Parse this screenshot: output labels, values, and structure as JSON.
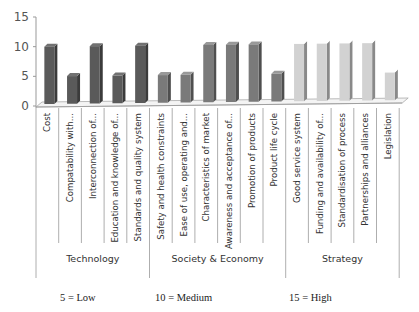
{
  "chart_data": {
    "type": "bar",
    "title": "",
    "xlabel": "",
    "ylabel": "",
    "ylim": [
      0,
      15
    ],
    "yticks": [
      0,
      5,
      10,
      15
    ],
    "grid": false,
    "style": "3d-column",
    "categories": [
      "Cost",
      "Compatability with...",
      "Interconnection of...",
      "Education and knowledge of...",
      "Standards and quality system",
      "Safety and health constraints",
      "Ease of use, operating and...",
      "Characteristics of market",
      "Awareness and acceptance of...",
      "Promotion of products",
      "Product life cycle",
      "Good service system",
      "Funding and availability of...",
      "Standardisation of process",
      "Partnerships and alliances",
      "Legislation"
    ],
    "values": [
      10,
      5,
      10,
      5,
      10,
      5,
      5,
      10,
      10,
      10,
      5,
      10,
      10,
      10,
      10,
      5
    ],
    "groups": [
      {
        "name": "Technology",
        "start": 0,
        "end": 4,
        "color": "#5a5a5a"
      },
      {
        "name": "Society & Economy",
        "start": 5,
        "end": 10,
        "color": "#7a7a7a"
      },
      {
        "name": "Strategy",
        "start": 11,
        "end": 15,
        "color": "#d2d2d2"
      }
    ],
    "legend": [
      "5 = Low",
      "10 = Medium",
      "15 = High"
    ]
  }
}
